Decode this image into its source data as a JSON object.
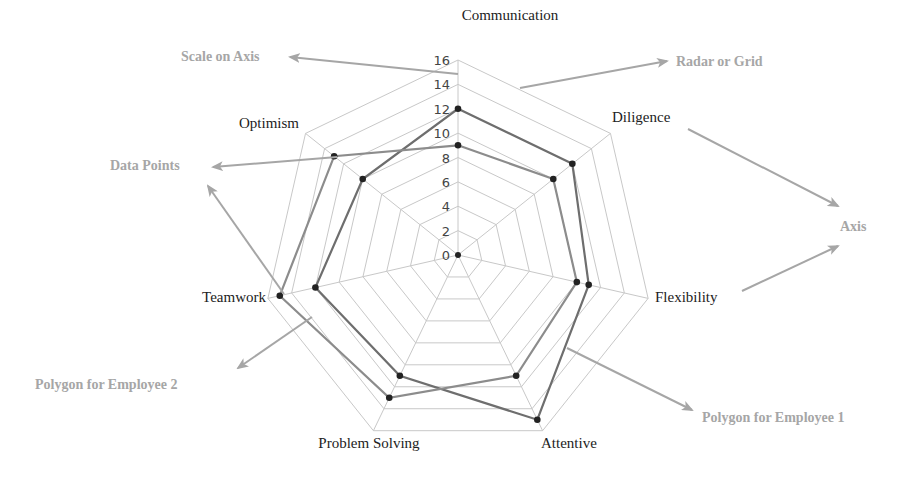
{
  "chart_data": {
    "type": "radar",
    "title": "",
    "axes": [
      "Communication",
      "Diligence",
      "Flexibility",
      "Attentive",
      "Problem Solving",
      "Teamwork",
      "Optimism"
    ],
    "scale": {
      "min": 0,
      "max": 16,
      "step": 2,
      "ticks": [
        "0",
        "2",
        "4",
        "6",
        "8",
        "10",
        "12",
        "14",
        "16"
      ]
    },
    "grid": true,
    "series": [
      {
        "name": "Employee 1",
        "values": [
          12,
          12,
          11,
          15,
          11,
          12,
          10
        ],
        "color": "#6e6e6e"
      },
      {
        "name": "Employee 2",
        "values": [
          9,
          10,
          10,
          11,
          13,
          15,
          13
        ],
        "color": "#8c8c8c"
      }
    ],
    "annotations": [
      {
        "label": "Scale on Axis"
      },
      {
        "label": "Radar or Grid"
      },
      {
        "label": "Data Points"
      },
      {
        "label": "Axis"
      },
      {
        "label": "Polygon for Employee 2"
      },
      {
        "label": "Polygon for Employee 1"
      }
    ],
    "legend": "none"
  },
  "colors": {
    "grid": "#c8c8c8",
    "annotation": "#a6a6a6",
    "dot": "#222222"
  }
}
